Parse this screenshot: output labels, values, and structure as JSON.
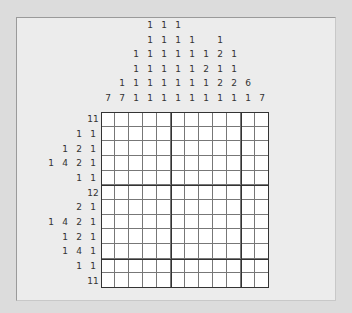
{
  "puzzle": {
    "type": "nonogram",
    "columns": 12,
    "rows": 12,
    "column_clues": [
      [
        7
      ],
      [
        1,
        7
      ],
      [
        1,
        1,
        1,
        1
      ],
      [
        1,
        1,
        1,
        1,
        1,
        1
      ],
      [
        1,
        1,
        1,
        1,
        1,
        1
      ],
      [
        1,
        1,
        1,
        1,
        1,
        1
      ],
      [
        1,
        1,
        1,
        1,
        1
      ],
      [
        1,
        2,
        1,
        1
      ],
      [
        1,
        2,
        1,
        2,
        1
      ],
      [
        1,
        1,
        2,
        1
      ],
      [
        6,
        1
      ],
      [
        7
      ]
    ],
    "row_clues": [
      [
        11
      ],
      [
        1,
        1
      ],
      [
        1,
        2,
        1
      ],
      [
        1,
        4,
        2,
        1
      ],
      [
        1,
        1
      ],
      [
        12
      ],
      [
        2,
        1
      ],
      [
        1,
        4,
        2,
        1
      ],
      [
        1,
        2,
        1
      ],
      [
        1,
        4,
        1
      ],
      [
        1,
        1
      ],
      [
        11
      ]
    ],
    "filled_cells": []
  },
  "colors": {
    "background": "#dcdcdc",
    "panel": "#ececec",
    "grid_bg": "#ffffff",
    "clue_text": "#333333",
    "grid_line": "#777777",
    "thick_line": "#333333"
  }
}
